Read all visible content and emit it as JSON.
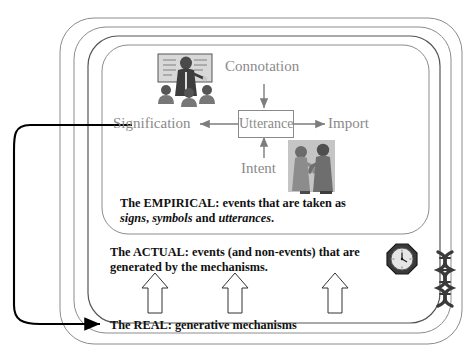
{
  "diagram": {
    "layers": [
      {
        "id": "empirical",
        "name": "empirical-layer",
        "text_lead": "The EMPIRICAL: events that are taken as",
        "text_line2_pre": "signs",
        "text_line2_mid1": ", ",
        "text_line2_sym": "symbols",
        "text_line2_mid2": " and ",
        "text_line2_utt": "utterances",
        "text_line2_end": "."
      },
      {
        "id": "actual",
        "name": "actual-layer",
        "text_lead": "The ACTUAL: events (and non-events) that are",
        "text_line2": "generated by the mechanisms."
      },
      {
        "id": "real",
        "name": "real-layer",
        "text_lead": "The REAL: generative mechanisms"
      }
    ],
    "semiotic": {
      "center_node": "Utterance",
      "top_node": "Connotation",
      "bottom_node": "Intent",
      "left_node": "Signification",
      "right_node": "Import"
    },
    "icons": {
      "classroom": "classroom-teacher-icon",
      "conversation": "two-people-conversing-icon",
      "clock": "octagonal-clock-icon",
      "dna": "dna-double-helix-icon"
    },
    "arrows": {
      "generative_count": 3,
      "feedback_label": "signification-to-real-feedback-arrow"
    },
    "colors": {
      "grey_text": "#8a8a8a",
      "black_text": "#111111",
      "outline": "#6e6e6e",
      "inner_outline": "#3a3a3a",
      "arrow_grey": "#7d7d7d",
      "arrow_black": "#000000"
    }
  }
}
